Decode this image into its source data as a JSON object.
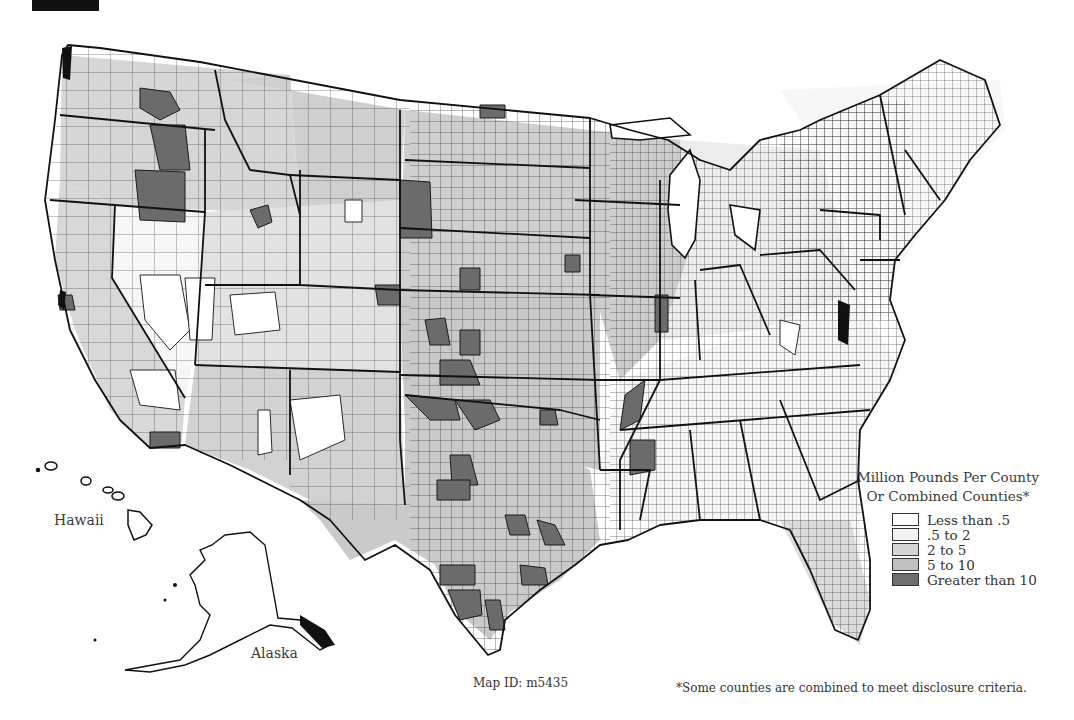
{
  "map": {
    "map_id_label": "Map ID: m5435",
    "footnote": "*Some counties are combined to meet disclosure criteria.",
    "inset_labels": {
      "hawaii": "Hawaii",
      "alaska": "Alaska"
    },
    "legend": {
      "title_line1": "Million Pounds Per County",
      "title_line2": "Or Combined Counties*",
      "items": [
        {
          "label": "Less than .5",
          "color": "#ffffff"
        },
        {
          "label": ".5 to 2",
          "color": "#f2f2f2"
        },
        {
          "label": "2 to 5",
          "color": "#d4d4d4"
        },
        {
          "label": "5 to 10",
          "color": "#c0c0c0"
        },
        {
          "label": "Greater than 10",
          "color": "#6e6e6e"
        }
      ]
    },
    "colors": {
      "outline": "#1a1a1a",
      "county_line": "#2a2a2a",
      "background": "#ffffff"
    }
  }
}
